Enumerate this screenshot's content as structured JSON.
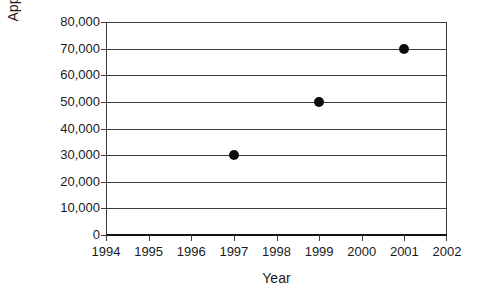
{
  "chart_data": {
    "type": "scatter",
    "title": "",
    "xlabel": "Year",
    "ylabel": "Apples Produced",
    "x": [
      1997,
      1999,
      2001
    ],
    "values": [
      30000,
      50000,
      70000
    ],
    "series": [
      {
        "name": "Apples Produced",
        "points": [
          {
            "x": 1997,
            "y": 30000
          },
          {
            "x": 1999,
            "y": 50000
          },
          {
            "x": 2001,
            "y": 70000
          }
        ]
      }
    ],
    "xlim": [
      1994,
      2002
    ],
    "ylim": [
      0,
      80000
    ],
    "x_tick_labels": [
      "1994",
      "1995",
      "1996",
      "1997",
      "1998",
      "1999",
      "2000",
      "2001",
      "2002"
    ],
    "x_tick_values": [
      1994,
      1995,
      1996,
      1997,
      1998,
      1999,
      2000,
      2001,
      2002
    ],
    "y_tick_labels": [
      "80,000",
      "70,000",
      "60,000",
      "50,000",
      "40,000",
      "30,000",
      "20,000",
      "10,000",
      "0"
    ],
    "y_tick_values": [
      80000,
      70000,
      60000,
      50000,
      40000,
      30000,
      20000,
      10000,
      0
    ],
    "grid": true,
    "grid_axis": "y",
    "legend": false,
    "legend_position": "none",
    "marker": "filled-circle",
    "marker_color": "#0d0d0d",
    "grid_color": "#3d3d3d",
    "axis_color": "#111111",
    "background_color": "#ffffff"
  }
}
